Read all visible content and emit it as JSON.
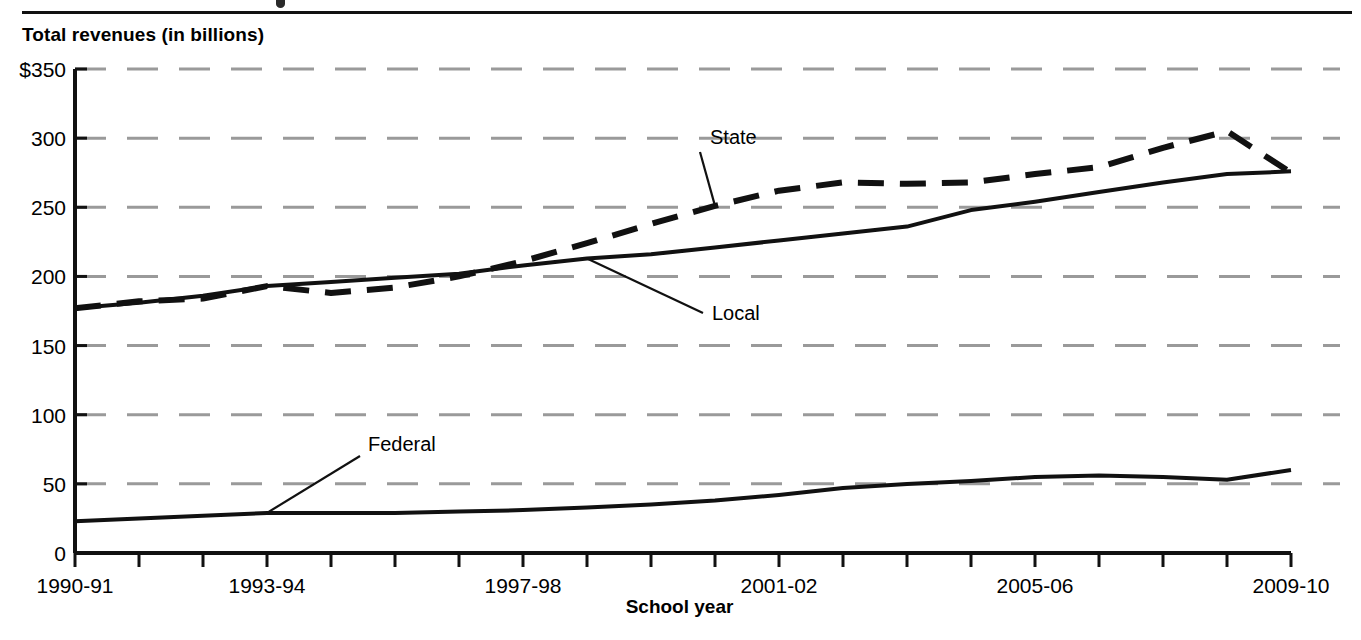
{
  "figure": {
    "y_axis_title": "Total revenues (in billions)",
    "x_axis_title": "School year"
  },
  "chart_data": {
    "type": "line",
    "title": "",
    "subtitle": "",
    "xlabel": "School year",
    "ylabel": "Total revenues (in billions)",
    "ylim": [
      0,
      350
    ],
    "ytick_labels": [
      "$350",
      "300",
      "250",
      "200",
      "150",
      "100",
      "50",
      "0"
    ],
    "ytick_values": [
      350,
      300,
      250,
      200,
      150,
      100,
      50,
      0
    ],
    "grid": "horizontal-dashed",
    "legend": "inline-callouts",
    "x": [
      "1990-91",
      "1991-92",
      "1992-93",
      "1993-94",
      "1994-95",
      "1995-96",
      "1996-97",
      "1997-98",
      "1998-99",
      "1999-2000",
      "2000-01",
      "2001-02",
      "2002-03",
      "2003-04",
      "2004-05",
      "2005-06",
      "2006-07",
      "2007-08",
      "2008-09",
      "2009-10"
    ],
    "xtick_labels_shown": [
      "1990-91",
      "1993-94",
      "1997-98",
      "2001-02",
      "2005-06",
      "2009-10"
    ],
    "xtick_label_indices": [
      0,
      3,
      7,
      11,
      15,
      19
    ],
    "series": [
      {
        "name": "State",
        "style": "dashed",
        "color": "#111111",
        "values": [
          177,
          182,
          184,
          193,
          188,
          192,
          200,
          211,
          224,
          238,
          251,
          262,
          268,
          267,
          268,
          274,
          279,
          293,
          305,
          275
        ]
      },
      {
        "name": "Local",
        "style": "solid",
        "color": "#111111",
        "values": [
          177,
          181,
          186,
          193,
          196,
          199,
          202,
          208,
          213,
          216,
          221,
          226,
          231,
          236,
          248,
          254,
          261,
          268,
          274,
          276
        ]
      },
      {
        "name": "Federal",
        "style": "solid",
        "color": "#111111",
        "values": [
          23,
          25,
          27,
          29,
          29,
          29,
          30,
          31,
          33,
          35,
          38,
          42,
          47,
          50,
          52,
          55,
          56,
          55,
          53,
          60
        ]
      }
    ],
    "annotations": [
      {
        "label": "State",
        "x_index": 10,
        "value": 251
      },
      {
        "label": "Local",
        "x_index": 8,
        "value": 213
      },
      {
        "label": "Federal",
        "x_index": 3,
        "value": 29
      }
    ]
  }
}
